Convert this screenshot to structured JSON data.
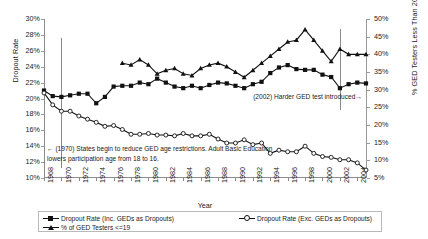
{
  "chart_data": {
    "type": "line",
    "title": "",
    "xlabel": "Year",
    "ylabel": "Dropout Rate",
    "ylabel_secondary": "% GED Testers Less Than 20",
    "grid": false,
    "legend_position": "bottom",
    "ylim": [
      10,
      30
    ],
    "ylim_secondary": [
      5,
      50
    ],
    "xlim": [
      1968,
      2005
    ],
    "yticks": [
      "10%",
      "12%",
      "14%",
      "16%",
      "18%",
      "20%",
      "22%",
      "24%",
      "26%",
      "28%",
      "30%"
    ],
    "yticks_secondary": [
      "5%",
      "10%",
      "15%",
      "20%",
      "25%",
      "30%",
      "35%",
      "40%",
      "45%",
      "50%"
    ],
    "xticks": [
      "1968",
      "1970",
      "1972",
      "1974",
      "1976",
      "1978",
      "1980",
      "1982",
      "1984",
      "1986",
      "1988",
      "1990",
      "1992",
      "1994",
      "1996",
      "1998",
      "2000",
      "2002",
      "2004"
    ],
    "x": [
      1968,
      1969,
      1970,
      1971,
      1972,
      1973,
      1974,
      1975,
      1976,
      1977,
      1978,
      1979,
      1980,
      1981,
      1982,
      1983,
      1984,
      1985,
      1986,
      1987,
      1988,
      1989,
      1990,
      1991,
      1992,
      1993,
      1994,
      1995,
      1996,
      1997,
      1998,
      1999,
      2000,
      2001,
      2002,
      2003,
      2004,
      2005
    ],
    "series": [
      {
        "name": "Dropout Rate (Inc. GEDs as Dropouts)",
        "axis": "left",
        "marker": "filled-square",
        "values": [
          21.0,
          20.3,
          20.2,
          20.4,
          20.6,
          20.6,
          19.4,
          20.2,
          21.5,
          21.6,
          21.6,
          22.0,
          21.8,
          22.5,
          22.0,
          21.5,
          21.3,
          21.6,
          21.3,
          21.7,
          22.0,
          21.9,
          21.6,
          21.3,
          21.8,
          22.1,
          23.2,
          23.9,
          24.2,
          23.7,
          23.6,
          23.6,
          23.0,
          22.7,
          21.3,
          21.8,
          22.0,
          21.9
        ]
      },
      {
        "name": "Dropout Rate (Exc. GEDs as Dropouts)",
        "axis": "left",
        "marker": "open-circle",
        "values": [
          20.7,
          19.2,
          18.4,
          18.4,
          17.8,
          17.4,
          17.0,
          16.5,
          16.6,
          16.1,
          15.5,
          15.5,
          15.6,
          15.4,
          15.4,
          15.3,
          15.6,
          15.3,
          15.3,
          15.5,
          14.9,
          14.4,
          14.4,
          14.8,
          14.2,
          14.4,
          13.1,
          13.5,
          13.3,
          13.3,
          14.0,
          13.1,
          12.7,
          12.6,
          12.3,
          12.3,
          11.9,
          11.0
        ]
      },
      {
        "name": "% of GED Testers <=19",
        "axis": "right",
        "marker": "filled-triangle",
        "values": [
          null,
          null,
          null,
          null,
          null,
          null,
          null,
          null,
          null,
          37.5,
          37.0,
          38.5,
          37.0,
          34.5,
          35.5,
          36.0,
          34.5,
          34.0,
          36.0,
          37.0,
          37.5,
          36.5,
          35.0,
          33.5,
          35.5,
          37.5,
          39.5,
          41.5,
          43.5,
          44.0,
          47.0,
          44.0,
          41.0,
          38.0,
          41.5,
          40.0,
          40.0,
          40.0
        ]
      }
    ],
    "annotations": [
      {
        "name": "1970-policy-note",
        "text": "← (1970) States begin to reduce GED age restrictions. Adult Basic Education lowers participation age from 18 to 16.",
        "vline_year": 1970
      },
      {
        "name": "2002-test-note",
        "text": "(2002) Harder GED  test introduced→",
        "vline_year": 2002
      }
    ]
  },
  "legend": {
    "items": [
      {
        "label": "Dropout Rate (Inc. GEDs as Dropouts)",
        "marker": "filled-square"
      },
      {
        "label": "Dropout Rate (Exc. GEDs as Dropouts)",
        "marker": "open-circle"
      },
      {
        "label": "% of GED Testers <=19",
        "marker": "filled-triangle"
      }
    ]
  }
}
